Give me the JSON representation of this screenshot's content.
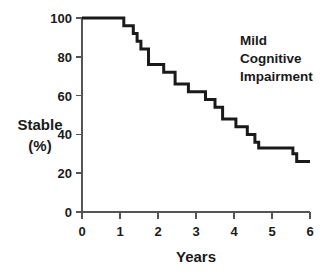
{
  "chart_data": {
    "type": "line",
    "subtype": "kaplan-meier-step",
    "title": "",
    "xlabel": "Years",
    "ylabel": "Stable\n(%)",
    "ylabel_line1": "Stable",
    "ylabel_line2": "(%)",
    "xlim": [
      0,
      6
    ],
    "ylim": [
      0,
      100
    ],
    "xticks": [
      0,
      1,
      2,
      3,
      4,
      5,
      6
    ],
    "xtick_labels": [
      "0",
      "1",
      "2",
      "3",
      "4",
      "5",
      "6"
    ],
    "yticks": [
      0,
      20,
      40,
      60,
      80,
      100
    ],
    "ytick_labels": [
      "0",
      "20",
      "40",
      "60",
      "80",
      "100"
    ],
    "grid": false,
    "legend": false,
    "line_color": "#1a1a1a",
    "axis_color": "#555555",
    "annotations": [
      {
        "name": "group-label",
        "lines": [
          "Mild",
          "Cognitive",
          "Impairment"
        ],
        "x": 4.3,
        "y": 88
      }
    ],
    "series": [
      {
        "name": "Mild Cognitive Impairment",
        "x": [
          0.0,
          1.0,
          1.1,
          1.25,
          1.35,
          1.45,
          1.55,
          1.7,
          1.75,
          2.05,
          2.15,
          2.35,
          2.45,
          2.6,
          2.8,
          2.95,
          3.25,
          3.35,
          3.5,
          3.6,
          3.7,
          3.8,
          4.05,
          4.15,
          4.35,
          4.45,
          4.55,
          4.65,
          5.45,
          5.55,
          5.65,
          6.0
        ],
        "y": [
          100,
          100,
          96,
          96,
          92,
          88,
          84,
          84,
          76,
          76,
          72,
          72,
          66,
          66,
          62,
          62,
          58,
          58,
          54,
          54,
          48,
          48,
          44,
          44,
          40,
          40,
          36,
          33,
          33,
          30,
          26,
          26
        ]
      }
    ]
  }
}
